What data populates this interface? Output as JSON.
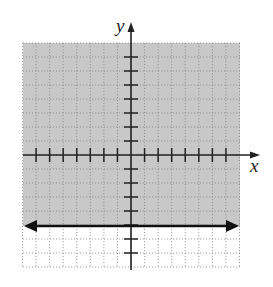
{
  "chart_data": {
    "type": "line",
    "title": "",
    "xlabel": "x",
    "ylabel": "y",
    "xlim": [
      -8,
      8
    ],
    "ylim": [
      -8,
      8
    ],
    "grid": true,
    "series": [
      {
        "name": "boundary line y = -5",
        "style": "solid",
        "x": [
          -8,
          8
        ],
        "y": [
          -5,
          -5
        ]
      }
    ],
    "shaded_region": {
      "inequality": "y >= -5",
      "description": "shaded above the line y = -5",
      "color": "#c8c8c8"
    },
    "colors": {
      "shade": "#c8c8c8",
      "grid": "#8a8a8a",
      "axis": "#222222",
      "line": "#111111"
    }
  },
  "labels": {
    "x_axis": "x",
    "y_axis": "y"
  }
}
